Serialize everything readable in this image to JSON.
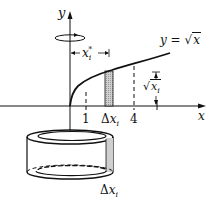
{
  "diagram": {
    "axes": {
      "y_label": "y",
      "x_label": "x"
    },
    "curve": {
      "label_prefix": "y = ",
      "radical_symbol": "√",
      "radicand": "x"
    },
    "x_ticks": [
      {
        "label": "1"
      },
      {
        "label": "4"
      }
    ],
    "strip": {
      "width_label_delta": "Δ",
      "width_label_var": "x",
      "width_label_sub": "i"
    },
    "sample_point": {
      "var": "x",
      "sub": "i",
      "sup": "*"
    },
    "height": {
      "radical_symbol": "√",
      "var": "x",
      "sub": "i"
    },
    "shell": {
      "thickness_delta": "Δ",
      "thickness_var": "x",
      "thickness_sub": "i"
    },
    "colors": {
      "line": "#111111",
      "strip_fill": "#c8c8c8",
      "background": "#ffffff"
    }
  }
}
